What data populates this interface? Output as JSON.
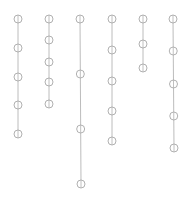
{
  "diagram": {
    "width": 192,
    "height": 206,
    "background": "#ffffff",
    "stroke_color": "#a8a8a8",
    "node_radius": 4,
    "chains": [
      {
        "id": "chain-1",
        "x_top": 18,
        "x_bottom": 18,
        "nodes_y": [
          19,
          48,
          77,
          105,
          134
        ]
      },
      {
        "id": "chain-2",
        "x_top": 49,
        "x_bottom": 49,
        "nodes_y": [
          19,
          40,
          62,
          82,
          104
        ]
      },
      {
        "id": "chain-3",
        "x_top": 80,
        "x_bottom": 81,
        "nodes_y": [
          19,
          74,
          129,
          184
        ]
      },
      {
        "id": "chain-4",
        "x_top": 112,
        "x_bottom": 112,
        "nodes_y": [
          19,
          50,
          81,
          111,
          141
        ]
      },
      {
        "id": "chain-5",
        "x_top": 143,
        "x_bottom": 143,
        "nodes_y": [
          19,
          44,
          68
        ]
      },
      {
        "id": "chain-6",
        "x_top": 173,
        "x_bottom": 174,
        "nodes_y": [
          19,
          51,
          84,
          116,
          148
        ]
      }
    ]
  }
}
